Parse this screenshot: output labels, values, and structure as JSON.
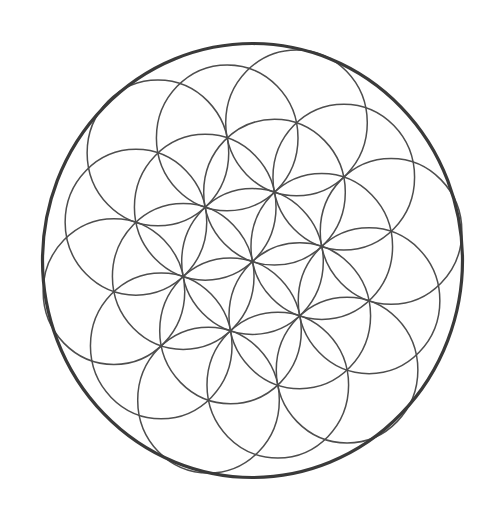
{
  "diagram": {
    "lattice_rings": 2,
    "circle_count": 19,
    "colors": {
      "background": "#ffffff",
      "pattern_stroke": "#4d4d4d",
      "boundary_stroke": "#3a3a3a"
    }
  }
}
